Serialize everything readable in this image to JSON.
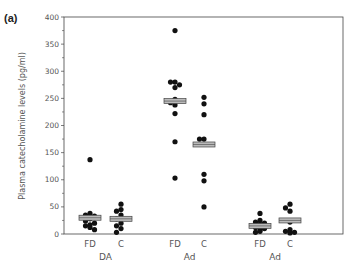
{
  "panel_label": "(a)",
  "chart_data": {
    "type": "scatter",
    "title": "",
    "panel_label": "(a)",
    "xlabel": "",
    "ylabel": "Plasma catecholamine levels (pg/ml)",
    "ylim": [
      0,
      400
    ],
    "yticks": [
      0,
      50,
      100,
      150,
      200,
      250,
      300,
      350,
      400
    ],
    "grid": false,
    "legend": null,
    "groups": [
      {
        "name": "DA",
        "series": [
          {
            "name": "FD",
            "x_px": 90,
            "median": 30,
            "values": [
              137,
              38,
              35,
              33,
              30,
              28,
              24,
              20,
              17,
              15,
              12,
              8
            ]
          },
          {
            "name": "C",
            "x_px": 121,
            "median": 28,
            "values": [
              55,
              45,
              42,
              35,
              28,
              20,
              15,
              10,
              3
            ]
          }
        ]
      },
      {
        "name": "Ad",
        "series": [
          {
            "name": "FD",
            "x_px": 175,
            "median": 245,
            "values": [
              375,
              280,
              280,
              275,
              270,
              248,
              242,
              238,
              222,
              170,
              103
            ]
          },
          {
            "name": "C",
            "x_px": 204,
            "median": 165,
            "values": [
              252,
              240,
              220,
              175,
              175,
              110,
              98,
              50
            ]
          }
        ]
      },
      {
        "name": "Ad",
        "series": [
          {
            "name": "FD",
            "x_px": 260,
            "median": 15,
            "values": [
              38,
              25,
              22,
              20,
              18,
              15,
              12,
              10,
              8,
              5,
              3
            ]
          },
          {
            "name": "C",
            "x_px": 290,
            "median": 25,
            "values": [
              55,
              48,
              42,
              22,
              8,
              5,
              3,
              2
            ]
          }
        ]
      }
    ]
  },
  "colors": {
    "axis": "#444444",
    "points": "#111111",
    "median_fill": "#bbbbbb",
    "median_stroke": "#444444",
    "text": "#555555"
  }
}
